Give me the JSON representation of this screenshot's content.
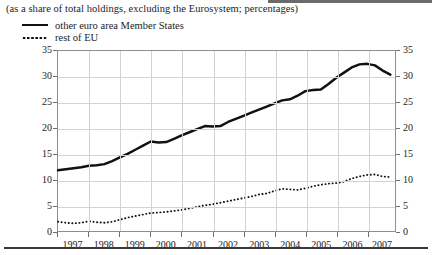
{
  "figure": {
    "subtitle": "(as a share of total holdings, excluding the Eurosystem; percentages)"
  },
  "legend": {
    "items": [
      {
        "label": "other euro area Member States",
        "style": "solid",
        "color": "#111111",
        "icon": "solid-line-swatch"
      },
      {
        "label": "rest of EU",
        "style": "dotted",
        "color": "#111111",
        "icon": "dotted-line-swatch"
      }
    ]
  },
  "axes": {
    "y_ticks": [
      "0",
      "5",
      "10",
      "15",
      "20",
      "25",
      "30",
      "35"
    ],
    "x_ticks": [
      "1997",
      "1998",
      "1999",
      "2000",
      "2001",
      "2002",
      "2003",
      "2004",
      "2005",
      "2006",
      "2007"
    ]
  },
  "chart_data": {
    "type": "line",
    "title": "",
    "subtitle": "(as a share of total holdings, excluding the Eurosystem; percentages)",
    "xlabel": "",
    "ylabel": "",
    "ylim": [
      0,
      35
    ],
    "xlim": [
      1997.0,
      2007.9
    ],
    "grid": true,
    "legend_position": "top-left",
    "y_axis_dual_labels": true,
    "x": [
      1997.0,
      1997.25,
      1997.5,
      1997.75,
      1998.0,
      1998.25,
      1998.5,
      1998.75,
      1999.0,
      1999.25,
      1999.5,
      1999.75,
      2000.0,
      2000.25,
      2000.5,
      2000.75,
      2001.0,
      2001.25,
      2001.5,
      2001.75,
      2002.0,
      2002.25,
      2002.5,
      2002.75,
      2003.0,
      2003.25,
      2003.5,
      2003.75,
      2004.0,
      2004.25,
      2004.5,
      2004.75,
      2005.0,
      2005.25,
      2005.5,
      2005.75,
      2006.0,
      2006.25,
      2006.5,
      2006.75,
      2007.0,
      2007.25,
      2007.5,
      2007.75
    ],
    "series": [
      {
        "name": "other euro area Member States",
        "style": "solid",
        "color": "#111111",
        "values": [
          11.8,
          12.0,
          12.2,
          12.4,
          12.7,
          12.8,
          13.0,
          13.6,
          14.3,
          15.0,
          15.8,
          16.6,
          17.4,
          17.2,
          17.3,
          17.9,
          18.6,
          19.2,
          19.8,
          20.4,
          20.3,
          20.4,
          21.2,
          21.8,
          22.4,
          23.0,
          23.6,
          24.2,
          24.8,
          25.4,
          25.6,
          26.3,
          27.2,
          27.4,
          27.5,
          28.6,
          29.8,
          30.8,
          31.8,
          32.4,
          32.5,
          32.2,
          31.2,
          30.4
        ]
      },
      {
        "name": "rest of EU",
        "style": "dotted",
        "color": "#111111",
        "values": [
          1.8,
          1.6,
          1.5,
          1.6,
          1.9,
          1.7,
          1.6,
          1.8,
          2.2,
          2.6,
          2.9,
          3.2,
          3.5,
          3.6,
          3.7,
          3.9,
          4.1,
          4.4,
          4.7,
          5.0,
          5.2,
          5.5,
          5.8,
          6.1,
          6.4,
          6.7,
          7.1,
          7.3,
          7.8,
          8.2,
          8.1,
          8.0,
          8.3,
          8.7,
          9.0,
          9.2,
          9.3,
          9.6,
          10.2,
          10.6,
          10.9,
          11.0,
          10.6,
          10.5
        ]
      }
    ]
  }
}
